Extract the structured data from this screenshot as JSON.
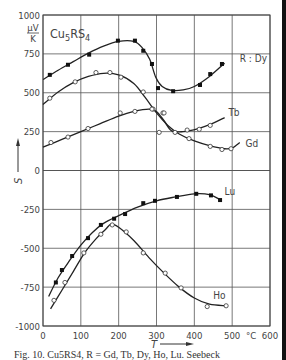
{
  "chart_data": {
    "type": "line",
    "title": "Cu5RS4",
    "title_main": "Cu",
    "title_sub": "5",
    "title_mid": "RS",
    "title_sub2": "4",
    "xlabel": "T",
    "x_unit": "°C",
    "ylabel": "S",
    "y_unit_num": "µV",
    "y_unit_den": "K",
    "xlim": [
      0,
      600
    ],
    "ylim": [
      -1000,
      1000
    ],
    "xticks": [
      0,
      100,
      200,
      300,
      400,
      500,
      600
    ],
    "yticks": [
      1000,
      750,
      500,
      250,
      0,
      -250,
      -500,
      -750,
      -1000
    ],
    "grid": true,
    "legend_prefix": "R : ",
    "series": [
      {
        "name": "Dy",
        "label": "R : Dy",
        "marker": "filled",
        "points": [
          [
            18,
            615
          ],
          [
            66,
            680
          ],
          [
            122,
            745
          ],
          [
            198,
            835
          ],
          [
            243,
            835
          ],
          [
            265,
            770
          ],
          [
            288,
            685
          ],
          [
            304,
            530
          ],
          [
            344,
            510
          ],
          [
            415,
            550
          ],
          [
            442,
            620
          ],
          [
            473,
            685
          ]
        ],
        "curve": [
          [
            0,
            585
          ],
          [
            40,
            645
          ],
          [
            80,
            700
          ],
          [
            120,
            755
          ],
          [
            160,
            800
          ],
          [
            200,
            830
          ],
          [
            240,
            830
          ],
          [
            262,
            790
          ],
          [
            282,
            715
          ],
          [
            298,
            600
          ],
          [
            315,
            540
          ],
          [
            340,
            515
          ],
          [
            370,
            518
          ],
          [
            400,
            540
          ],
          [
            440,
            605
          ],
          [
            480,
            690
          ]
        ],
        "label_pos": [
          520,
          720
        ]
      },
      {
        "name": "Gd",
        "label": "Gd",
        "marker": "open",
        "points": [
          [
            18,
            465
          ],
          [
            85,
            570
          ],
          [
            140,
            630
          ],
          [
            177,
            630
          ],
          [
            206,
            600
          ],
          [
            265,
            505
          ],
          [
            291,
            395
          ],
          [
            317,
            370
          ],
          [
            386,
            205
          ],
          [
            442,
            155
          ],
          [
            473,
            135
          ],
          [
            497,
            140
          ]
        ],
        "curve": [
          [
            0,
            425
          ],
          [
            40,
            505
          ],
          [
            80,
            565
          ],
          [
            120,
            605
          ],
          [
            160,
            625
          ],
          [
            200,
            615
          ],
          [
            240,
            560
          ],
          [
            270,
            470
          ],
          [
            300,
            370
          ],
          [
            330,
            290
          ],
          [
            360,
            235
          ],
          [
            400,
            190
          ],
          [
            440,
            160
          ],
          [
            480,
            140
          ],
          [
            500,
            145
          ],
          [
            520,
            180
          ]
        ],
        "label_pos": [
          535,
          168
        ]
      },
      {
        "name": "Tb",
        "label": "Tb",
        "marker": "open",
        "points": [
          [
            21,
            180
          ],
          [
            66,
            215
          ],
          [
            119,
            270
          ],
          [
            204,
            370
          ],
          [
            243,
            380
          ],
          [
            288,
            395
          ],
          [
            320,
            370
          ],
          [
            307,
            245
          ],
          [
            349,
            245
          ],
          [
            381,
            260
          ],
          [
            413,
            265
          ],
          [
            442,
            290
          ]
        ],
        "curve": [
          [
            0,
            150
          ],
          [
            50,
            200
          ],
          [
            100,
            250
          ],
          [
            150,
            300
          ],
          [
            200,
            350
          ],
          [
            240,
            380
          ],
          [
            280,
            395
          ],
          [
            300,
            380
          ],
          [
            320,
            320
          ],
          [
            340,
            255
          ],
          [
            370,
            250
          ],
          [
            410,
            270
          ],
          [
            450,
            305
          ],
          [
            480,
            340
          ]
        ],
        "label_pos": [
          490,
          370
        ]
      },
      {
        "name": "Lu",
        "label": "Lu",
        "marker": "filled",
        "points": [
          [
            34,
            -720
          ],
          [
            50,
            -640
          ],
          [
            77,
            -550
          ],
          [
            119,
            -435
          ],
          [
            153,
            -350
          ],
          [
            188,
            -310
          ],
          [
            217,
            -280
          ],
          [
            265,
            -210
          ],
          [
            296,
            -195
          ],
          [
            354,
            -170
          ],
          [
            405,
            -150
          ],
          [
            444,
            -160
          ],
          [
            468,
            -190
          ]
        ],
        "curve": [
          [
            15,
            -810
          ],
          [
            40,
            -690
          ],
          [
            70,
            -580
          ],
          [
            100,
            -480
          ],
          [
            130,
            -400
          ],
          [
            160,
            -340
          ],
          [
            200,
            -290
          ],
          [
            250,
            -235
          ],
          [
            300,
            -195
          ],
          [
            350,
            -170
          ],
          [
            400,
            -150
          ],
          [
            440,
            -155
          ],
          [
            470,
            -190
          ]
        ],
        "label_pos": [
          480,
          -140
        ]
      },
      {
        "name": "Ho",
        "label": "Ho",
        "marker": "open",
        "points": [
          [
            29,
            -835
          ],
          [
            58,
            -720
          ],
          [
            108,
            -530
          ],
          [
            153,
            -410
          ],
          [
            183,
            -350
          ],
          [
            220,
            -395
          ],
          [
            265,
            -530
          ],
          [
            323,
            -660
          ],
          [
            365,
            -755
          ],
          [
            434,
            -875
          ],
          [
            484,
            -870
          ]
        ],
        "curve": [
          [
            20,
            -890
          ],
          [
            50,
            -770
          ],
          [
            80,
            -650
          ],
          [
            110,
            -530
          ],
          [
            140,
            -440
          ],
          [
            165,
            -380
          ],
          [
            180,
            -345
          ],
          [
            200,
            -365
          ],
          [
            240,
            -450
          ],
          [
            280,
            -560
          ],
          [
            320,
            -660
          ],
          [
            360,
            -750
          ],
          [
            400,
            -820
          ],
          [
            440,
            -860
          ],
          [
            484,
            -870
          ]
        ],
        "label_pos": [
          450,
          -810
        ]
      }
    ]
  },
  "caption": "Fig. 10. Cu5RS4, R = Gd, Tb, Dy, Ho, Lu. Seebeck"
}
